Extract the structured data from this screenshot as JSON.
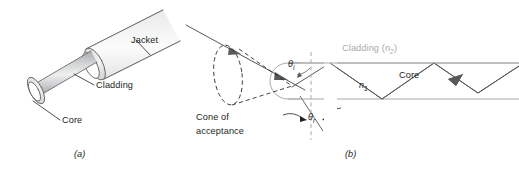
{
  "figure": {
    "panel_a": {
      "caption": "(a)",
      "labels": {
        "jacket": "Jacket",
        "cladding": "Cladding",
        "core": "Core"
      }
    },
    "panel_b": {
      "caption": "(b)",
      "labels": {
        "cladding": "Cladding (n",
        "cladding_sub": "2",
        "cladding_close": ")",
        "core": "Core",
        "core_index": "n",
        "core_index_sub": "1",
        "theta_i": "θ",
        "theta_i_sub": "i",
        "theta_r": "θ",
        "theta_r_sub": "r",
        "cone_line1": "Cone of",
        "cone_line2": "acceptance"
      }
    },
    "colors": {
      "line": "#58595b",
      "line_dark": "#231f20",
      "cladding_gray": "#a7a9ac",
      "fiber_fill_light": "#f2f2f2",
      "fiber_fill_mid": "#d9d9d9",
      "fiber_fill_dark": "#bcbec0",
      "background": "#ffffff"
    }
  }
}
